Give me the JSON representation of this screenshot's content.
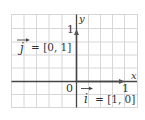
{
  "figure": {
    "type": "coordinate-grid-unit-vectors",
    "axes": {
      "x_label": "x",
      "y_label": "y",
      "origin_label": "0",
      "x_tick_label": "1",
      "y_tick_label": "1"
    },
    "vectors": [
      {
        "name": "i",
        "label_lhs": "i",
        "label_rhs": "= [1, 0]",
        "components": [
          1,
          0
        ]
      },
      {
        "name": "j",
        "label_lhs": "j",
        "label_rhs": "= [0, 1]",
        "components": [
          0,
          1
        ]
      }
    ],
    "colors": {
      "grid": "#d6d6d6",
      "axis": "#444444",
      "text": "#333333",
      "background": "#ffffff"
    }
  }
}
